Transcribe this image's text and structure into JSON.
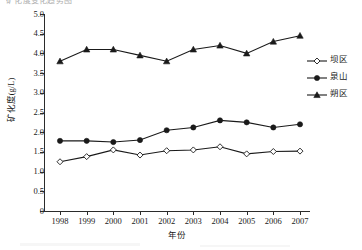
{
  "figure": {
    "partial_title": "矿化度变化趋势图",
    "background_color": "#ffffff",
    "axis_color": "#2b2b2b"
  },
  "legend": {
    "position": "right",
    "entries": [
      {
        "label": "坝区",
        "marker": "open-diamond",
        "color": "#1a1a1a"
      },
      {
        "label": "泉山",
        "marker": "filled-circle",
        "color": "#1a1a1a"
      },
      {
        "label": "朔区",
        "marker": "filled-triangle",
        "color": "#1a1a1a"
      }
    ]
  },
  "chart_data": {
    "type": "line",
    "title": "矿化度变化趋势图",
    "xlabel": "年份",
    "ylabel": "矿化度(g/L)",
    "categories": [
      1998,
      1999,
      2000,
      2001,
      2002,
      2003,
      2004,
      2005,
      2006,
      2007
    ],
    "x_tick_labels": [
      "1998",
      "1999",
      "2000",
      "2001",
      "2002",
      "2003",
      "2004",
      "2005",
      "2006",
      "2007"
    ],
    "y_tick_labels": [
      "0",
      "0.5",
      "1.0",
      "1.5",
      "2.0",
      "2.5",
      "3.0",
      "3.5",
      "4.0",
      "4.5",
      "5.0"
    ],
    "y_tick_values": [
      0,
      0.5,
      1.0,
      1.5,
      2.0,
      2.5,
      3.0,
      3.5,
      4.0,
      4.5,
      5.0
    ],
    "ylim": [
      0,
      5.0
    ],
    "grid": false,
    "legend_position": "right",
    "series": [
      {
        "name": "坝区",
        "marker": "open-diamond",
        "color": "#1a1a1a",
        "values": [
          1.25,
          1.38,
          1.55,
          1.42,
          1.53,
          1.55,
          1.63,
          1.45,
          1.51,
          1.52
        ]
      },
      {
        "name": "泉山",
        "marker": "filled-circle",
        "color": "#1a1a1a",
        "values": [
          1.78,
          1.78,
          1.75,
          1.8,
          2.05,
          2.12,
          2.3,
          2.25,
          2.12,
          2.2
        ]
      },
      {
        "name": "朔区",
        "marker": "filled-triangle",
        "color": "#1a1a1a",
        "values": [
          3.8,
          4.1,
          4.1,
          3.95,
          3.8,
          4.1,
          4.2,
          4.0,
          4.3,
          4.45
        ]
      }
    ]
  }
}
